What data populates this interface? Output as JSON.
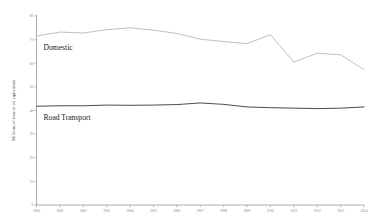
{
  "chart_data": {
    "type": "line",
    "title": "",
    "subtitle": "",
    "xlabel": "",
    "ylabel": "Millions of tons of oil equivalent",
    "xlim": [
      2000,
      2014
    ],
    "ylim": [
      0,
      80
    ],
    "yticks": [
      0,
      10,
      20,
      30,
      40,
      50,
      60,
      70,
      80
    ],
    "ytick_labels": [
      "0",
      "10",
      "20",
      "30",
      "40",
      "50",
      "60",
      "70",
      "80"
    ],
    "grid": false,
    "legend_position": "inline",
    "x": [
      2000,
      2001,
      2002,
      2003,
      2004,
      2005,
      2006,
      2007,
      2008,
      2009,
      2010,
      2011,
      2012,
      2013,
      2014
    ],
    "xtick_labels": [
      "2000",
      "2001",
      "2002",
      "2003",
      "2004",
      "2005",
      "2006",
      "2007",
      "2008",
      "2009",
      "2010",
      "2011",
      "2012",
      "2013",
      "2014"
    ],
    "series": [
      {
        "name": "Domestic",
        "color": "#b9b9b9",
        "values": [
          71.5,
          73.2,
          72.8,
          74.2,
          75.0,
          74.0,
          72.6,
          70.2,
          69.2,
          68.3,
          72.1,
          60.5,
          64.2,
          63.6,
          57.3
        ]
      },
      {
        "name": "Road Transport",
        "color": "#4c4c4c",
        "values": [
          41.8,
          42.0,
          42.0,
          42.3,
          42.2,
          42.3,
          42.5,
          43.2,
          42.6,
          41.5,
          41.2,
          41.0,
          40.8,
          41.0,
          41.5
        ]
      }
    ],
    "annotations": [
      {
        "text": "Domestic",
        "x": 2000.3,
        "y": 65.5
      },
      {
        "text": "Road Transport",
        "x": 2000.3,
        "y": 36.0
      }
    ]
  }
}
